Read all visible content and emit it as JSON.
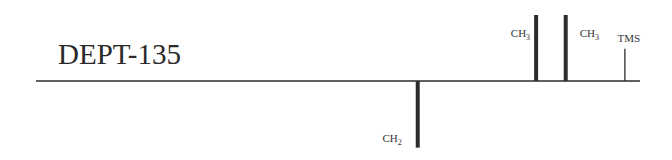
{
  "chart_data": {
    "type": "bar",
    "title": "DEPT-135",
    "xlabel": "",
    "ylabel": "",
    "axis_ticks_shown": false,
    "grid": false,
    "x_units": "relative position along baseline (no ppm scale shown)",
    "x_range": [
      0,
      1
    ],
    "y_range": [
      -1,
      1
    ],
    "peaks": [
      {
        "name": "CH2",
        "label_main": "CH",
        "label_sub": "2",
        "position": 0.632,
        "intensity": -0.98,
        "weight": "thick",
        "label_side": "left",
        "label_vertical": "bottom"
      },
      {
        "name": "CH3-a",
        "label_main": "CH",
        "label_sub": "3",
        "position": 0.828,
        "intensity": 1.0,
        "weight": "thick",
        "label_side": "left",
        "label_vertical": "top"
      },
      {
        "name": "CH3-b",
        "label_main": "CH",
        "label_sub": "3",
        "position": 0.877,
        "intensity": 1.0,
        "weight": "thick",
        "label_side": "right",
        "label_vertical": "top"
      },
      {
        "name": "TMS",
        "label_main": "TMS",
        "label_sub": "",
        "position": 0.975,
        "intensity": 0.49,
        "weight": "thin",
        "label_side": "center",
        "label_vertical": "above"
      }
    ]
  },
  "colors": {
    "ink": "#2b2b2b",
    "background": "#ffffff"
  }
}
